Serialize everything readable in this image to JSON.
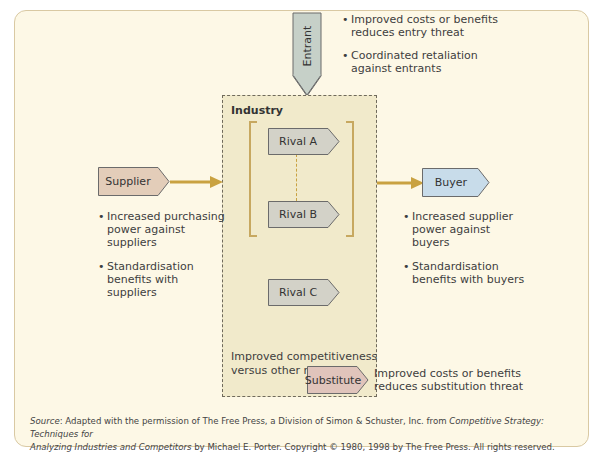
{
  "diagram": {
    "entrant": {
      "label": "Entrant",
      "bullets": [
        [
          "Improved costs or benefits",
          "reduces entry threat"
        ],
        [
          "Coordinated retaliation",
          "against entrants"
        ]
      ]
    },
    "industry": {
      "label": "Industry",
      "rivals": [
        "Rival A",
        "Rival B",
        "Rival C"
      ],
      "note": [
        "Improved competitiveness",
        "versus other rivals"
      ]
    },
    "supplier": {
      "label": "Supplier",
      "bullets": [
        [
          "Increased purchasing",
          "power against",
          "suppliers"
        ],
        [
          "Standardisation",
          "benefits with",
          "suppliers"
        ]
      ]
    },
    "buyer": {
      "label": "Buyer",
      "bullets": [
        [
          "Increased supplier",
          "power against",
          "buyers"
        ],
        [
          "Standardisation",
          "benefits with buyers"
        ]
      ]
    },
    "substitute": {
      "label": "Substitute",
      "note": [
        "Improved costs or benefits",
        "reduces substitution threat"
      ]
    }
  },
  "footer": {
    "source_label": "Source",
    "line1_pre": ": Adapted with the permission of The Free Press, a Division of Simon & Schuster, Inc. from ",
    "line1_italic": "Competitive Strategy: Techniques for",
    "line2_italic": "Analyzing Industries and Competitors",
    "line2_post": " by Michael E. Porter. Copyright © 1980, 1998 by The Free Press. All rights reserved."
  },
  "colors": {
    "panel_bg": "#fdf8e6",
    "panel_border": "#d9c9a3",
    "industry_bg": "#f1eacb",
    "arrow_gold": "#c9a241",
    "rival_fill": "#d3d2c8",
    "entrant_fill": "#c6d0c8",
    "supplier_fill": "#e3cdb9",
    "buyer_fill": "#c8dcea",
    "substitute_fill": "#e0c4bb"
  }
}
